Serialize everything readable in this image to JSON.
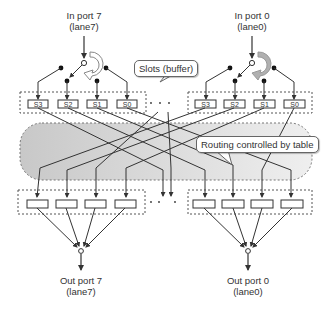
{
  "inputs": [
    {
      "name": "In port 7",
      "lane": "(lane7)"
    },
    {
      "name": "In port 0",
      "lane": "(lane0)"
    }
  ],
  "outputs": [
    {
      "name": "Out port 7",
      "lane": "(lane7)"
    },
    {
      "name": "Out port 0",
      "lane": "(lane0)"
    }
  ],
  "slots": [
    "S3",
    "S2",
    "S1",
    "S0"
  ],
  "callouts": {
    "slots": "Slots (buffer)",
    "routing": "Routing controlled by table"
  },
  "colors": {
    "line": "#333333",
    "region_fill": "#d9d9d9",
    "dashed": "#555555",
    "rotator_filled": "#b0b0b0"
  }
}
